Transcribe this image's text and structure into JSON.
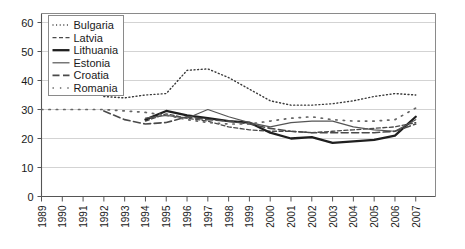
{
  "chart_data": {
    "type": "line",
    "title": "",
    "subtitle": "",
    "xlabel": "",
    "ylabel": "",
    "xlim": [
      1989,
      2007
    ],
    "ylim": [
      0,
      60
    ],
    "ytick_step": 10,
    "grid": true,
    "legend_position": "top-left",
    "categories": [
      1989,
      1990,
      1991,
      1992,
      1993,
      1994,
      1995,
      1996,
      1997,
      1998,
      1999,
      2000,
      2001,
      2002,
      2003,
      2004,
      2005,
      2006,
      2007
    ],
    "xticklabels": [
      "1989",
      "1990",
      "1991",
      "1992",
      "1993",
      "1994",
      "1995",
      "1996",
      "1997",
      "1998",
      "1999",
      "2000",
      "2001",
      "2002",
      "2003",
      "2004",
      "2005",
      "2006",
      "2007"
    ],
    "yticklabels": [
      "0",
      "10",
      "20",
      "30",
      "40",
      "50",
      "60"
    ],
    "yticks": [
      0,
      10,
      20,
      30,
      40,
      50,
      60
    ],
    "series": [
      {
        "name": "Bulgaria",
        "style": "dotted-fine",
        "color": "#3a3a3a",
        "width": 1.4,
        "dash": "1,2.6",
        "x": [
          1992,
          1993,
          1994,
          1995,
          1996,
          1997,
          1998,
          1999,
          2000,
          2001,
          2002,
          2003,
          2004,
          2005,
          2006,
          2007
        ],
        "values": [
          34.5,
          34.0,
          35.0,
          35.5,
          43.5,
          44.0,
          41.0,
          37.0,
          33.0,
          31.5,
          31.5,
          32.0,
          33.0,
          34.5,
          35.5,
          35.0
        ]
      },
      {
        "name": "Latvia",
        "style": "dashed-short",
        "color": "#4a4a4a",
        "width": 1.3,
        "dash": "4,2.5",
        "x": [
          1994,
          1995,
          1996,
          1997,
          1998,
          1999,
          2000,
          2001,
          2002,
          2003,
          2004,
          2005,
          2006,
          2007
        ],
        "values": [
          26.0,
          28.5,
          27.0,
          26.0,
          24.0,
          23.0,
          22.5,
          22.5,
          22.0,
          22.5,
          23.0,
          23.5,
          24.0,
          25.5
        ]
      },
      {
        "name": "Lithuania",
        "style": "solid-thick",
        "color": "#1f1f1f",
        "width": 2.3,
        "dash": "none",
        "x": [
          1994,
          1995,
          1996,
          1997,
          1998,
          1999,
          2000,
          2001,
          2002,
          2003,
          2004,
          2005,
          2006,
          2007
        ],
        "values": [
          26.5,
          29.5,
          28.0,
          27.0,
          26.0,
          25.5,
          22.0,
          20.0,
          20.5,
          18.5,
          19.0,
          19.5,
          21.0,
          27.5
        ]
      },
      {
        "name": "Estonia",
        "style": "solid-thin",
        "color": "#555555",
        "width": 1.2,
        "dash": "none",
        "x": [
          1994,
          1995,
          1996,
          1997,
          1998,
          1999,
          2000,
          2001,
          2002,
          2003,
          2004,
          2005,
          2006,
          2007
        ],
        "values": [
          27.0,
          28.0,
          27.0,
          30.0,
          27.5,
          25.5,
          24.0,
          25.5,
          26.0,
          26.0,
          24.0,
          23.0,
          22.5,
          26.5
        ]
      },
      {
        "name": "Croatia",
        "style": "dashed-long",
        "color": "#4a4a4a",
        "width": 1.6,
        "dash": "7,3.5",
        "x": [
          1992,
          1993,
          1994,
          1995,
          1996,
          1997,
          1998,
          1999,
          2000,
          2001,
          2002,
          2003,
          2004,
          2005,
          2006,
          2007
        ],
        "values": [
          29.5,
          26.5,
          25.0,
          25.5,
          27.5,
          26.5,
          26.0,
          25.0,
          23.5,
          22.5,
          22.0,
          22.0,
          22.0,
          22.0,
          22.5,
          25.0
        ]
      },
      {
        "name": "Romania",
        "style": "dotted-sparse",
        "color": "#666666",
        "width": 1.7,
        "dash": "1.4,6",
        "x": [
          1989,
          1990,
          1991,
          1992,
          1993,
          1994,
          1995,
          1996,
          1997,
          1998,
          1999,
          2000,
          2001,
          2002,
          2003,
          2004,
          2005,
          2006,
          2007
        ],
        "values": [
          30.0,
          30.0,
          30.0,
          30.0,
          29.5,
          29.0,
          28.0,
          26.5,
          25.5,
          25.0,
          25.0,
          26.0,
          27.0,
          27.5,
          26.5,
          26.0,
          26.0,
          26.5,
          30.5
        ]
      }
    ]
  },
  "legend": {
    "entries": [
      {
        "label": "Bulgaria"
      },
      {
        "label": "Latvia"
      },
      {
        "label": "Lithuania"
      },
      {
        "label": "Estonia"
      },
      {
        "label": "Croatia"
      },
      {
        "label": "Romania"
      }
    ]
  }
}
